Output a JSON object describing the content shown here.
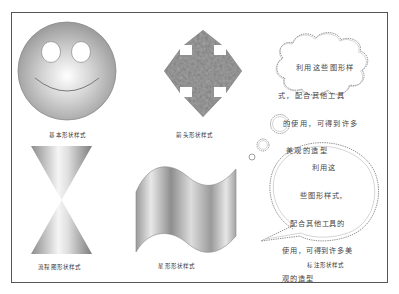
{
  "document": {
    "title": "Shape style examples",
    "frame_color": "#555555"
  },
  "shapes": [
    {
      "id": "smiley",
      "kind": "basic-shape",
      "caption": "基本形状样式"
    },
    {
      "id": "arrows",
      "kind": "arrow-shape",
      "caption": "箭头形状样式"
    },
    {
      "id": "cloud-callout",
      "kind": "callout-thought",
      "lines": [
        "利用这些图形样",
        "式，配合其他工具",
        "的使用，可得到许多",
        "美观的造型"
      ]
    },
    {
      "id": "hourglass",
      "kind": "flowchart-shape",
      "caption": "流程图形状样式"
    },
    {
      "id": "wave",
      "kind": "star-banner-shape",
      "caption": "星形形状样式"
    },
    {
      "id": "speech-callout",
      "kind": "callout-speech",
      "lines": [
        "利用这",
        "些图形样式，",
        "配合其他工具的",
        "使用，可得到许多美",
        "观的造型"
      ],
      "caption": "标注形状样式"
    }
  ],
  "captions": {
    "basic": "基本形状样式",
    "arrow": "箭头形状样式",
    "flowchart": "流程图形状样式",
    "star": "星形形状样式",
    "callout": "标注形状样式"
  },
  "callouts": {
    "cloud": {
      "line1": "利用这些图形样",
      "line2": "式，配合其他工具",
      "line3": "的使用，可得到许多",
      "line4": "美观的造型"
    },
    "speech": {
      "line1": "利用这",
      "line2": "些图形样式，",
      "line3": "配合其他工具的",
      "line4": "使用，可得到许多美",
      "line5": "观的造型"
    }
  }
}
